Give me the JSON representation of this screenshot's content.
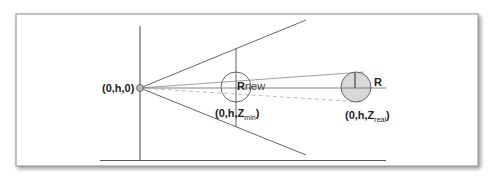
{
  "diagram": {
    "labels": {
      "origin": "(0,h,0)",
      "rnew_R": "R",
      "rnew_suffix": "new",
      "zmin_prefix": "(0,h,Z",
      "zmin_sub": "min",
      "zmin_suffix": ")",
      "r": "R",
      "zreal_prefix": "(0,h,Z",
      "zreal_sub": "real",
      "zreal_suffix": ")"
    },
    "colors": {
      "line": "#555555",
      "circle_fill": "#d8d8d8",
      "frame": "#8a8a8a",
      "dashed": "#aaaaaa"
    }
  }
}
